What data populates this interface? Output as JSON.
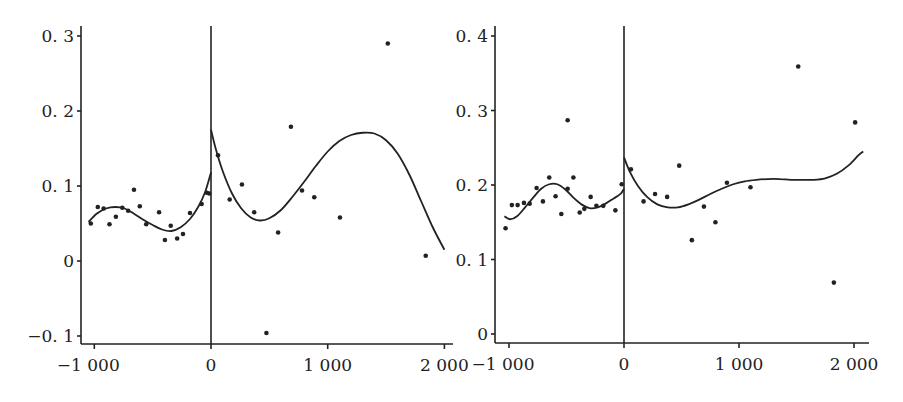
{
  "chart_data": [
    {
      "type": "scatter",
      "title": "",
      "xlabel": "",
      "ylabel": "",
      "xlim": [
        -1100,
        2060
      ],
      "ylim": [
        -0.11,
        0.31
      ],
      "grid": false,
      "legend": null,
      "cutoff_line_x": 0,
      "x_ticks": [
        -1000,
        0,
        1000,
        2000
      ],
      "x_tick_labels": [
        "−1 000",
        "0",
        "1 000",
        "2 000"
      ],
      "y_ticks": [
        -0.1,
        0,
        0.1,
        0.2,
        0.3
      ],
      "y_tick_labels": [
        "−0. 1",
        "0",
        "0. 1",
        "0. 2",
        "0. 3"
      ],
      "series": [
        {
          "name": "observations",
          "kind": "scatter",
          "points": [
            [
              -1030,
              0.05
            ],
            [
              -970,
              0.072
            ],
            [
              -920,
              0.07
            ],
            [
              -870,
              0.049
            ],
            [
              -815,
              0.059
            ],
            [
              -760,
              0.071
            ],
            [
              -710,
              0.067
            ],
            [
              -660,
              0.095
            ],
            [
              -610,
              0.073
            ],
            [
              -555,
              0.049
            ],
            [
              -445,
              0.065
            ],
            [
              -395,
              0.028
            ],
            [
              -345,
              0.047
            ],
            [
              -290,
              0.03
            ],
            [
              -240,
              0.036
            ],
            [
              -180,
              0.064
            ],
            [
              -80,
              0.076
            ],
            [
              -35,
              0.091
            ],
            [
              -15,
              0.09
            ],
            [
              60,
              0.141
            ],
            [
              160,
              0.082
            ],
            [
              265,
              0.102
            ],
            [
              370,
              0.065
            ],
            [
              475,
              -0.096
            ],
            [
              575,
              0.038
            ],
            [
              685,
              0.179
            ],
            [
              780,
              0.094
            ],
            [
              885,
              0.085
            ],
            [
              1105,
              0.058
            ],
            [
              1515,
              0.29
            ],
            [
              1840,
              0.007
            ]
          ]
        },
        {
          "name": "fit-left",
          "kind": "line",
          "points": [
            [
              -1050,
              0.052
            ],
            [
              -980,
              0.063
            ],
            [
              -900,
              0.07
            ],
            [
              -820,
              0.072
            ],
            [
              -740,
              0.07
            ],
            [
              -660,
              0.063
            ],
            [
              -580,
              0.055
            ],
            [
              -500,
              0.048
            ],
            [
              -420,
              0.042
            ],
            [
              -340,
              0.04
            ],
            [
              -260,
              0.045
            ],
            [
              -180,
              0.056
            ],
            [
              -110,
              0.072
            ],
            [
              -50,
              0.092
            ],
            [
              0,
              0.118
            ]
          ]
        },
        {
          "name": "fit-right",
          "kind": "line",
          "points": [
            [
              0,
              0.175
            ],
            [
              40,
              0.15
            ],
            [
              100,
              0.12
            ],
            [
              180,
              0.09
            ],
            [
              260,
              0.07
            ],
            [
              340,
              0.058
            ],
            [
              420,
              0.054
            ],
            [
              500,
              0.057
            ],
            [
              600,
              0.068
            ],
            [
              700,
              0.086
            ],
            [
              800,
              0.106
            ],
            [
              900,
              0.127
            ],
            [
              1000,
              0.146
            ],
            [
              1100,
              0.16
            ],
            [
              1200,
              0.168
            ],
            [
              1300,
              0.171
            ],
            [
              1400,
              0.17
            ],
            [
              1500,
              0.161
            ],
            [
              1600,
              0.143
            ],
            [
              1700,
              0.115
            ],
            [
              1800,
              0.08
            ],
            [
              1900,
              0.045
            ],
            [
              2000,
              0.015
            ]
          ]
        }
      ]
    },
    {
      "type": "scatter",
      "title": "",
      "xlabel": "",
      "ylabel": "",
      "xlim": [
        -1100,
        2100
      ],
      "ylim": [
        -0.01,
        0.41
      ],
      "grid": false,
      "legend": null,
      "cutoff_line_x": 0,
      "x_ticks": [
        -1000,
        0,
        1000,
        2000
      ],
      "x_tick_labels": [
        "−1 000",
        "0",
        "1 000",
        "2 000"
      ],
      "y_ticks": [
        0,
        0.1,
        0.2,
        0.3,
        0.4
      ],
      "y_tick_labels": [
        "0",
        "0. 1",
        "0. 2",
        "0. 3",
        "0. 4"
      ],
      "series": [
        {
          "name": "observations",
          "kind": "scatter",
          "points": [
            [
              -1030,
              0.142
            ],
            [
              -975,
              0.173
            ],
            [
              -925,
              0.173
            ],
            [
              -870,
              0.176
            ],
            [
              -820,
              0.175
            ],
            [
              -760,
              0.196
            ],
            [
              -705,
              0.178
            ],
            [
              -650,
              0.21
            ],
            [
              -595,
              0.185
            ],
            [
              -545,
              0.161
            ],
            [
              -490,
              0.287
            ],
            [
              -490,
              0.195
            ],
            [
              -440,
              0.21
            ],
            [
              -385,
              0.163
            ],
            [
              -345,
              0.168
            ],
            [
              -290,
              0.184
            ],
            [
              -240,
              0.172
            ],
            [
              -180,
              0.172
            ],
            [
              -75,
              0.166
            ],
            [
              -20,
              0.201
            ],
            [
              60,
              0.221
            ],
            [
              170,
              0.178
            ],
            [
              270,
              0.188
            ],
            [
              375,
              0.184
            ],
            [
              480,
              0.226
            ],
            [
              590,
              0.126
            ],
            [
              695,
              0.171
            ],
            [
              795,
              0.15
            ],
            [
              895,
              0.203
            ],
            [
              1100,
              0.197
            ],
            [
              1515,
              0.359
            ],
            [
              1825,
              0.069
            ],
            [
              2010,
              0.284
            ]
          ]
        },
        {
          "name": "fit-left",
          "kind": "line",
          "points": [
            [
              -1040,
              0.158
            ],
            [
              -990,
              0.154
            ],
            [
              -930,
              0.158
            ],
            [
              -860,
              0.17
            ],
            [
              -790,
              0.183
            ],
            [
              -720,
              0.195
            ],
            [
              -650,
              0.201
            ],
            [
              -580,
              0.201
            ],
            [
              -510,
              0.194
            ],
            [
              -440,
              0.183
            ],
            [
              -370,
              0.174
            ],
            [
              -300,
              0.169
            ],
            [
              -230,
              0.17
            ],
            [
              -160,
              0.175
            ],
            [
              -90,
              0.182
            ],
            [
              -30,
              0.188
            ],
            [
              0,
              0.195
            ]
          ]
        },
        {
          "name": "fit-right",
          "kind": "line",
          "points": [
            [
              0,
              0.237
            ],
            [
              50,
              0.218
            ],
            [
              120,
              0.199
            ],
            [
              200,
              0.184
            ],
            [
              290,
              0.174
            ],
            [
              380,
              0.17
            ],
            [
              470,
              0.17
            ],
            [
              560,
              0.174
            ],
            [
              650,
              0.18
            ],
            [
              750,
              0.188
            ],
            [
              850,
              0.195
            ],
            [
              950,
              0.201
            ],
            [
              1050,
              0.205
            ],
            [
              1150,
              0.207
            ],
            [
              1250,
              0.208
            ],
            [
              1350,
              0.208
            ],
            [
              1450,
              0.207
            ],
            [
              1550,
              0.207
            ],
            [
              1650,
              0.207
            ],
            [
              1750,
              0.209
            ],
            [
              1850,
              0.215
            ],
            [
              1950,
              0.226
            ],
            [
              2040,
              0.24
            ],
            [
              2080,
              0.245
            ]
          ]
        }
      ]
    }
  ],
  "panels": [
    {
      "frame": {
        "x_axis_y": 344,
        "y_axis_x": 81,
        "x_axis_end": 453,
        "y_axis_top": 26,
        "px_x0": 211,
        "px_per_1000x": 116.7,
        "px_y0": 261,
        "px_per_unit_y": 750
      }
    },
    {
      "frame": {
        "x_axis_y": 343,
        "y_axis_x": 495,
        "x_axis_end": 869,
        "y_axis_top": 26,
        "px_x0": 624,
        "px_per_1000x": 115,
        "px_y0": 334,
        "px_per_unit_y": 745
      }
    }
  ]
}
